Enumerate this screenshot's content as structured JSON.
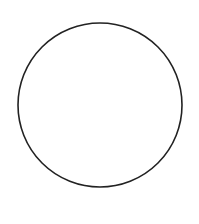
{
  "diagram": {
    "background": "#ffffff",
    "shapes": [
      {
        "type": "circle",
        "cx": 100,
        "cy": 105,
        "r": 82,
        "stroke": "#222222",
        "stroke_width": 1.6,
        "fill": "none"
      }
    ]
  }
}
